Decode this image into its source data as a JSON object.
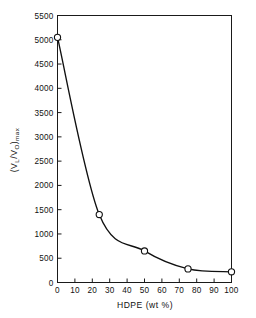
{
  "chart_data": {
    "type": "line",
    "title": "",
    "subtitle": "",
    "xlabel": "HDPE  (wt %)",
    "ylabel": "(V_L / V_O)_max",
    "ylabel_parts": {
      "open_paren": "(",
      "v1": "V",
      "v1_sub": "L",
      "slash": "/",
      "v2": "V",
      "v2_sub": "O",
      "close_paren": ")",
      "close_sub": "max"
    },
    "x": [
      0,
      24,
      50,
      75,
      100
    ],
    "values": [
      5050,
      1400,
      650,
      280,
      220
    ],
    "series": [
      {
        "name": "(VL/VO)max vs HDPE",
        "points": [
          {
            "x": 0,
            "y": 5050
          },
          {
            "x": 24,
            "y": 1400
          },
          {
            "x": 50,
            "y": 650
          },
          {
            "x": 75,
            "y": 280
          },
          {
            "x": 100,
            "y": 220
          }
        ]
      }
    ],
    "xlim": [
      0,
      100
    ],
    "ylim": [
      0,
      5500
    ],
    "xticks": [
      0,
      10,
      20,
      30,
      40,
      50,
      60,
      70,
      80,
      90,
      100
    ],
    "xtick_labels": [
      "0",
      "10",
      "20",
      "30",
      "40",
      "50",
      "60",
      "70",
      "80",
      "90",
      "100"
    ],
    "yticks": [
      0,
      500,
      1000,
      1500,
      2000,
      2500,
      3000,
      3500,
      4000,
      4500,
      5000,
      5500
    ],
    "ytick_labels": [
      "0",
      "500",
      "1000",
      "1500",
      "2000",
      "2500",
      "3000",
      "3500",
      "4000",
      "4500",
      "5000",
      "5500"
    ],
    "grid": false,
    "legend": false,
    "legend_position": "none",
    "marker": "open-circle",
    "line_color": "#101010",
    "marker_face_color": "#ffffff",
    "background_color": "#ffffff",
    "frame": "box",
    "tick_direction": "in",
    "annotations": []
  }
}
